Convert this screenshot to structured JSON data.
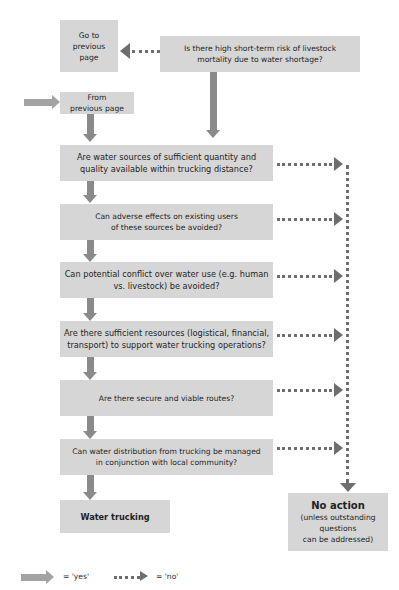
{
  "flowchart": {
    "go_back_box": "Go to\nprevious\npage",
    "top_question": "Is there high short-term risk of livestock\nmortality due to water shortage?",
    "from_prev_box": "From\nprevious page",
    "questions": [
      "Are water sources of sufficient quantity and\nquality available within trucking distance?",
      "Can adverse effects on existing users\nof these sources be avoided?",
      "Can potential conflict over water use (e.g. human\nvs. livestock) be avoided?",
      "Are there sufficient resources (logistical, financial,\ntransport) to support water trucking operations?",
      "Are there secure and viable routes?",
      "Can water distribution from trucking be managed\nin conjunction with local community?"
    ],
    "yes_outcome": "Water trucking",
    "no_outcome_title": "No action",
    "no_outcome_note": "(unless outstanding\nquestions\ncan be addressed)"
  },
  "legend": {
    "yes_label": "= 'yes'",
    "no_label": "= 'no'"
  },
  "colors": {
    "box_fill": "#d6d6d6",
    "yes_arrow": "#8a8a8a",
    "no_arrow": "#6e6e6e"
  }
}
